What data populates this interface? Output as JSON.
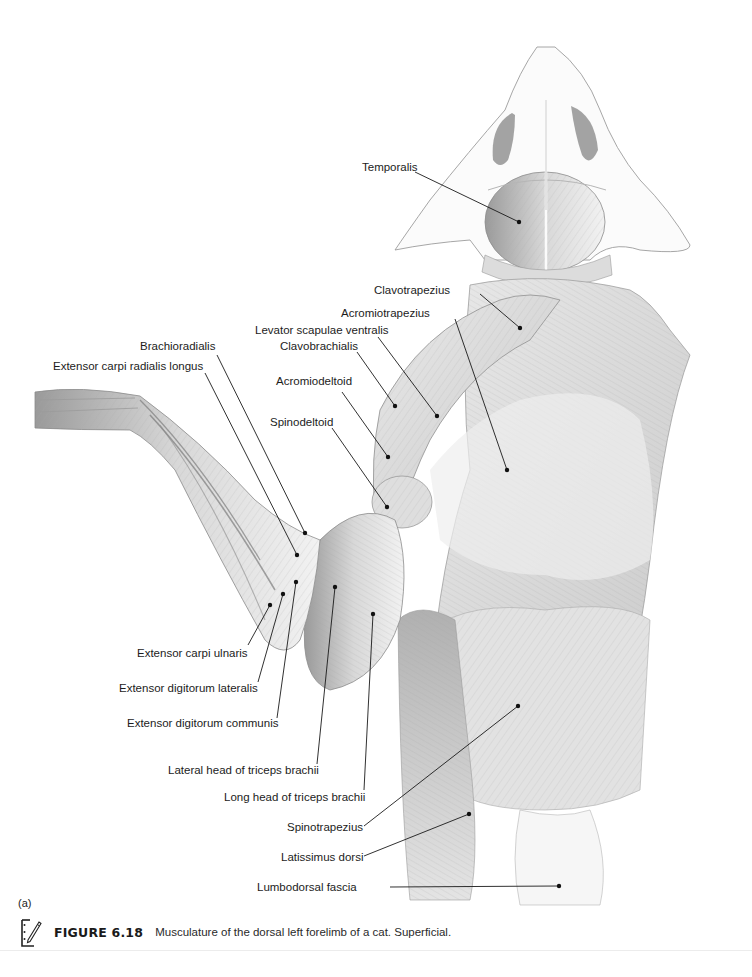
{
  "figure": {
    "panel_letter": "(a)",
    "number": "FIGURE 6.18",
    "caption": "Musculature of the dorsal left forelimb of a cat. Superficial.",
    "icon": "notebook-pencil-icon",
    "colors": {
      "background": "#ffffff",
      "ink": "#1a1a1a",
      "sketch": "#8a8a8a",
      "shade": "#bdbdbd"
    }
  },
  "labels": [
    {
      "id": "temporalis",
      "text": "Temporalis"
    },
    {
      "id": "clavotrapezius",
      "text": "Clavotrapezius"
    },
    {
      "id": "acromiotrapezius",
      "text": "Acromiotrapezius"
    },
    {
      "id": "levator-scapulae-ventralis",
      "text": "Levator scapulae ventralis"
    },
    {
      "id": "clavobrachialis",
      "text": "Clavobrachialis"
    },
    {
      "id": "acromiodeltoid",
      "text": "Acromiodeltoid"
    },
    {
      "id": "spinodeltoid",
      "text": "Spinodeltoid"
    },
    {
      "id": "brachioradialis",
      "text": "Brachioradialis"
    },
    {
      "id": "extensor-carpi-radialis-longus",
      "text": "Extensor carpi radialis longus"
    },
    {
      "id": "extensor-carpi-ulnaris",
      "text": "Extensor carpi ulnaris"
    },
    {
      "id": "extensor-digitorum-lateralis",
      "text": "Extensor digitorum lateralis"
    },
    {
      "id": "extensor-digitorum-communis",
      "text": "Extensor digitorum communis"
    },
    {
      "id": "lateral-head-triceps-brachii",
      "text": "Lateral head of triceps brachii"
    },
    {
      "id": "long-head-triceps-brachii",
      "text": "Long head of triceps brachii"
    },
    {
      "id": "spinotrapezius",
      "text": "Spinotrapezius"
    },
    {
      "id": "latissimus-dorsi",
      "text": "Latissimus dorsi"
    },
    {
      "id": "lumbodorsal-fascia",
      "text": "Lumbodorsal fascia"
    }
  ]
}
